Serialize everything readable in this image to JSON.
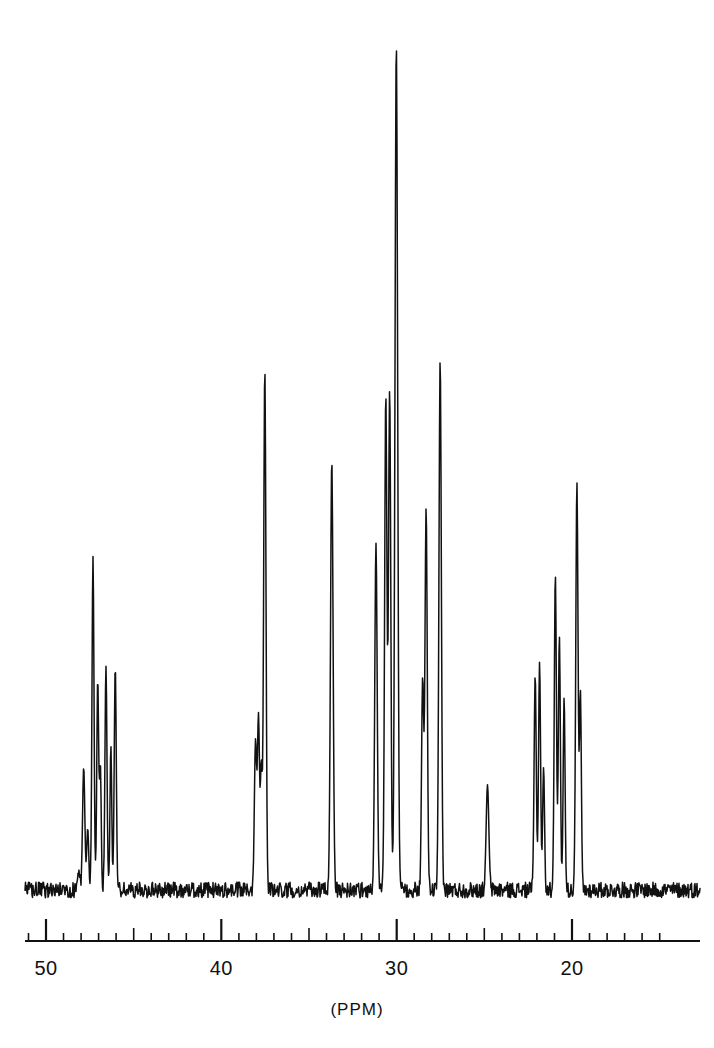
{
  "figure": {
    "kind": "nmr-spectrum",
    "background_color": "#ffffff",
    "trace_color": "#111111",
    "axis_color": "#111111"
  },
  "axis": {
    "unit_label": "(PPM)",
    "major_tick_labels": [
      "50",
      "40",
      "30",
      "20"
    ],
    "major_tick_values": [
      50,
      40,
      30,
      20
    ],
    "direction": "decreasing-left-to-right"
  },
  "chart_data": {
    "type": "line",
    "title": "",
    "subtitle": "",
    "xlabel": "(PPM)",
    "ylabel": "",
    "xlim": [
      51.5,
      14.5
    ],
    "ylim": [
      0,
      1.0
    ],
    "grid": false,
    "legend": null,
    "axis_reversed": true,
    "major_ticks": [
      50,
      40,
      30,
      20
    ],
    "mid_ticks": [
      45,
      35,
      25
    ],
    "minor_tick_step": 1,
    "minor_tick_range": [
      51,
      15
    ],
    "baseline_level": 0.035,
    "noise_amplitude": 0.009,
    "annotations": [],
    "peaks": [
      {
        "ppm": 48.15,
        "height": 0.055,
        "width": 0.1,
        "label": ""
      },
      {
        "ppm": 47.85,
        "height": 0.175,
        "width": 0.085,
        "label": ""
      },
      {
        "ppm": 47.62,
        "height": 0.105,
        "width": 0.075,
        "label": ""
      },
      {
        "ppm": 47.32,
        "height": 0.415,
        "width": 0.075,
        "label": ""
      },
      {
        "ppm": 47.05,
        "height": 0.275,
        "width": 0.07,
        "label": ""
      },
      {
        "ppm": 46.9,
        "height": 0.175,
        "width": 0.065,
        "label": ""
      },
      {
        "ppm": 46.58,
        "height": 0.29,
        "width": 0.075,
        "label": ""
      },
      {
        "ppm": 46.3,
        "height": 0.2,
        "width": 0.065,
        "label": ""
      },
      {
        "ppm": 46.05,
        "height": 0.29,
        "width": 0.075,
        "label": ""
      },
      {
        "ppm": 38.05,
        "height": 0.205,
        "width": 0.085,
        "label": ""
      },
      {
        "ppm": 37.88,
        "height": 0.23,
        "width": 0.075,
        "label": ""
      },
      {
        "ppm": 37.72,
        "height": 0.175,
        "width": 0.07,
        "label": ""
      },
      {
        "ppm": 37.52,
        "height": 0.63,
        "width": 0.085,
        "label": ""
      },
      {
        "ppm": 33.7,
        "height": 0.525,
        "width": 0.095,
        "label": ""
      },
      {
        "ppm": 31.18,
        "height": 0.43,
        "width": 0.09,
        "label": ""
      },
      {
        "ppm": 30.62,
        "height": 0.6,
        "width": 0.085,
        "label": ""
      },
      {
        "ppm": 30.4,
        "height": 0.605,
        "width": 0.085,
        "label": ""
      },
      {
        "ppm": 30.02,
        "height": 1.0,
        "width": 0.1,
        "label": ""
      },
      {
        "ppm": 28.52,
        "height": 0.275,
        "width": 0.08,
        "label": ""
      },
      {
        "ppm": 28.32,
        "height": 0.47,
        "width": 0.085,
        "label": ""
      },
      {
        "ppm": 27.52,
        "height": 0.64,
        "width": 0.09,
        "label": ""
      },
      {
        "ppm": 24.82,
        "height": 0.155,
        "width": 0.1,
        "label": ""
      },
      {
        "ppm": 22.1,
        "height": 0.28,
        "width": 0.08,
        "label": ""
      },
      {
        "ppm": 21.85,
        "height": 0.295,
        "width": 0.075,
        "label": ""
      },
      {
        "ppm": 21.62,
        "height": 0.175,
        "width": 0.07,
        "label": ""
      },
      {
        "ppm": 20.95,
        "height": 0.395,
        "width": 0.08,
        "label": ""
      },
      {
        "ppm": 20.72,
        "height": 0.325,
        "width": 0.075,
        "label": ""
      },
      {
        "ppm": 20.45,
        "height": 0.255,
        "width": 0.07,
        "label": ""
      },
      {
        "ppm": 19.72,
        "height": 0.5,
        "width": 0.085,
        "label": ""
      },
      {
        "ppm": 19.52,
        "height": 0.26,
        "width": 0.07,
        "label": ""
      }
    ]
  }
}
